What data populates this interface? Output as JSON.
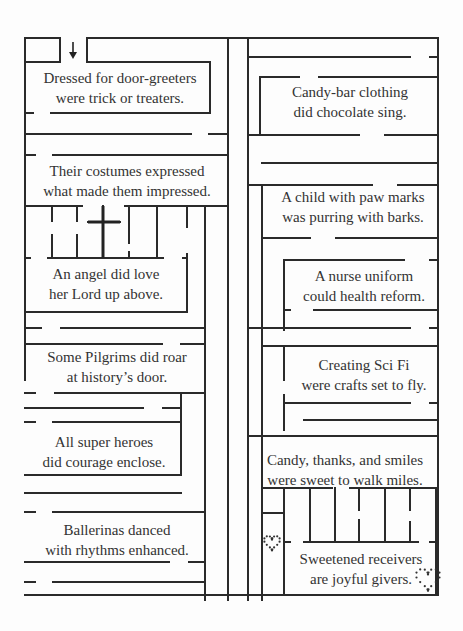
{
  "colors": {
    "line": "#2a2a2a",
    "text": "#333333",
    "background": "#fdfdfd"
  },
  "start_marker": {
    "icon": "down-arrow-icon",
    "x": 71,
    "y": 42
  },
  "verses": [
    {
      "id": "door-greeters",
      "lines": [
        "Dressed for door-greeters",
        "were trick or treaters."
      ],
      "x": 118,
      "y": 68
    },
    {
      "id": "candy-bar",
      "lines": [
        "Candy-bar clothing",
        "did chocolate sing."
      ],
      "x": 344,
      "y": 82
    },
    {
      "id": "costumes",
      "lines": [
        "Their costumes expressed",
        "what made them impressed."
      ],
      "x": 120,
      "y": 166
    },
    {
      "id": "paw-marks",
      "lines": [
        "A child with paw marks",
        "was purring with barks."
      ],
      "x": 354,
      "y": 188
    },
    {
      "id": "angel",
      "lines": [
        "An angel did love",
        "her Lord up above."
      ],
      "x": 107,
      "y": 265
    },
    {
      "id": "nurse",
      "lines": [
        "A nurse uniform",
        "could health reform."
      ],
      "x": 362,
      "y": 266
    },
    {
      "id": "pilgrims",
      "lines": [
        "Some Pilgrims did roar",
        "at history’s door."
      ],
      "x": 115,
      "y": 347
    },
    {
      "id": "sci-fi",
      "lines": [
        "Creating Sci Fi",
        "were crafts set to fly."
      ],
      "x": 361,
      "y": 357
    },
    {
      "id": "super-heroes",
      "lines": [
        "All super heroes",
        "did courage enclose."
      ],
      "x": 103,
      "y": 433
    },
    {
      "id": "candy-thanks",
      "lines": [
        "Candy, thanks, and smiles",
        "were sweet to walk miles."
      ],
      "x": 346,
      "y": 452
    },
    {
      "id": "ballerinas",
      "lines": [
        "Ballerinas danced",
        "with rhythms enhanced."
      ],
      "x": 115,
      "y": 528
    },
    {
      "id": "sweetened",
      "lines": [
        "Sweetened receivers",
        "are joyful givers."
      ],
      "x": 362,
      "y": 561
    }
  ],
  "decorations": {
    "cross": {
      "icon": "cross-icon",
      "x": 103,
      "y": 222
    },
    "small_heart": {
      "icon": "dotted-heart-icon",
      "x": 272,
      "y": 542
    },
    "end_heart": {
      "icon": "dotted-heart-icon",
      "x": 428,
      "y": 578
    }
  },
  "maze_lines": [
    [
      25,
      38,
      60,
      38
    ],
    [
      60,
      38,
      60,
      62
    ],
    [
      25,
      62,
      60,
      62
    ],
    [
      87,
      38,
      438,
      38
    ],
    [
      87,
      38,
      87,
      62
    ],
    [
      87,
      62,
      210,
      62
    ],
    [
      210,
      62,
      210,
      113
    ],
    [
      51,
      113,
      210,
      113
    ],
    [
      25,
      38,
      25,
      123
    ],
    [
      25,
      113,
      33,
      113
    ],
    [
      25,
      123,
      25,
      380
    ],
    [
      25,
      134,
      191,
      134
    ],
    [
      209,
      134,
      228,
      134
    ],
    [
      25,
      155,
      35,
      155
    ],
    [
      53,
      155,
      228,
      155
    ],
    [
      228,
      38,
      228,
      600
    ],
    [
      25,
      206,
      82,
      206
    ],
    [
      25,
      206,
      25,
      206
    ],
    [
      125,
      206,
      228,
      206
    ],
    [
      52,
      206,
      52,
      221
    ],
    [
      52,
      235,
      52,
      258
    ],
    [
      77,
      206,
      77,
      221
    ],
    [
      77,
      235,
      77,
      258
    ],
    [
      103,
      206,
      103,
      258
    ],
    [
      88,
      222,
      120,
      222
    ],
    [
      129,
      206,
      129,
      243
    ],
    [
      129,
      252,
      129,
      258
    ],
    [
      157,
      206,
      157,
      258
    ],
    [
      187,
      206,
      187,
      227
    ],
    [
      187,
      254,
      187,
      312
    ],
    [
      205,
      206,
      205,
      600
    ],
    [
      48,
      258,
      163,
      258
    ],
    [
      25,
      258,
      30,
      258
    ],
    [
      183,
      258,
      187,
      258
    ],
    [
      25,
      312,
      187,
      312
    ],
    [
      25,
      328,
      41,
      328
    ],
    [
      61,
      328,
      205,
      328
    ],
    [
      25,
      344,
      162,
      344
    ],
    [
      181,
      344,
      205,
      344
    ],
    [
      25,
      393,
      35,
      393
    ],
    [
      55,
      393,
      205,
      393
    ],
    [
      181,
      393,
      181,
      470
    ],
    [
      25,
      408,
      143,
      408
    ],
    [
      163,
      408,
      181,
      408
    ],
    [
      25,
      422,
      35,
      422
    ],
    [
      53,
      422,
      181,
      422
    ],
    [
      181,
      470,
      181,
      475
    ],
    [
      25,
      475,
      181,
      475
    ],
    [
      25,
      493,
      181,
      493
    ],
    [
      25,
      512,
      35,
      512
    ],
    [
      53,
      512,
      205,
      512
    ],
    [
      25,
      562,
      169,
      562
    ],
    [
      189,
      562,
      205,
      562
    ],
    [
      25,
      582,
      35,
      582
    ],
    [
      53,
      582,
      205,
      582
    ],
    [
      25,
      595,
      438,
      595
    ],
    [
      248,
      38,
      248,
      600
    ],
    [
      248,
      57,
      410,
      57
    ],
    [
      430,
      57,
      438,
      57
    ],
    [
      438,
      38,
      438,
      595
    ],
    [
      260,
      77,
      299,
      77
    ],
    [
      319,
      77,
      438,
      77
    ],
    [
      260,
      77,
      260,
      135
    ],
    [
      248,
      135,
      359,
      135
    ],
    [
      385,
      135,
      438,
      135
    ],
    [
      262,
      163,
      438,
      163
    ],
    [
      248,
      185,
      372,
      185
    ],
    [
      398,
      185,
      438,
      185
    ],
    [
      262,
      185,
      262,
      600
    ],
    [
      248,
      203,
      248,
      203
    ],
    [
      262,
      238,
      310,
      238
    ],
    [
      336,
      238,
      438,
      238
    ],
    [
      284,
      260,
      404,
      260
    ],
    [
      430,
      260,
      438,
      260
    ],
    [
      284,
      260,
      284,
      330
    ],
    [
      284,
      310,
      290,
      310
    ],
    [
      314,
      310,
      438,
      310
    ],
    [
      248,
      328,
      410,
      328
    ],
    [
      430,
      328,
      438,
      328
    ],
    [
      262,
      346,
      438,
      346
    ],
    [
      262,
      346,
      262,
      420
    ],
    [
      284,
      346,
      284,
      380
    ],
    [
      284,
      395,
      284,
      430
    ],
    [
      284,
      403,
      410,
      403
    ],
    [
      430,
      403,
      438,
      403
    ],
    [
      304,
      420,
      438,
      420
    ],
    [
      248,
      436,
      410,
      436
    ],
    [
      430,
      436,
      438,
      436
    ],
    [
      248,
      436,
      248,
      436
    ],
    [
      262,
      436,
      438,
      436
    ],
    [
      262,
      488,
      332,
      488
    ],
    [
      332,
      488,
      332,
      488
    ],
    [
      350,
      488,
      438,
      488
    ],
    [
      262,
      488,
      262,
      595
    ],
    [
      284,
      488,
      284,
      595
    ],
    [
      262,
      513,
      284,
      513
    ],
    [
      310,
      488,
      310,
      542
    ],
    [
      335,
      488,
      335,
      542
    ],
    [
      359,
      488,
      359,
      510
    ],
    [
      359,
      520,
      359,
      542
    ],
    [
      385,
      488,
      385,
      542
    ],
    [
      410,
      488,
      410,
      510
    ],
    [
      410,
      522,
      410,
      542
    ],
    [
      436,
      488,
      436,
      595
    ],
    [
      304,
      542,
      418,
      542
    ],
    [
      284,
      542,
      290,
      542
    ],
    [
      430,
      542,
      438,
      542
    ]
  ]
}
